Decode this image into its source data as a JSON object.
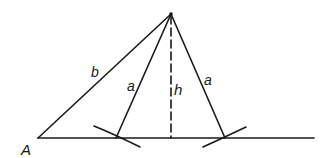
{
  "diagram": {
    "type": "geometric-construction",
    "colors": {
      "stroke": "#1a1a1a",
      "background": "#ffffff"
    },
    "points": {
      "apex": {
        "x": 171,
        "y": 14
      },
      "A": {
        "x": 38,
        "y": 138
      },
      "left_intersection": {
        "x": 116,
        "y": 138
      },
      "right_intersection": {
        "x": 225,
        "y": 138
      },
      "foot": {
        "x": 171,
        "y": 138
      },
      "baseline_end": {
        "x": 314,
        "y": 138
      }
    },
    "labels": {
      "point_A": "A",
      "side_b": "b",
      "side_a_left": "a",
      "height_h": "h",
      "side_a_right": "a"
    },
    "segments": [
      {
        "name": "b",
        "from": "A",
        "to": "apex",
        "style": "solid"
      },
      {
        "name": "a-left",
        "from": "left_intersection",
        "to": "apex",
        "style": "solid"
      },
      {
        "name": "a-right",
        "from": "right_intersection",
        "to": "apex",
        "style": "solid"
      },
      {
        "name": "h",
        "from": "apex",
        "to": "foot",
        "style": "dashed"
      },
      {
        "name": "baseline",
        "from": "A",
        "to": "baseline_end",
        "style": "solid"
      }
    ],
    "arcs": [
      {
        "name": "left-arc",
        "center": "apex",
        "radius_label": "a"
      },
      {
        "name": "right-arc",
        "center": "apex",
        "radius_label": "a"
      }
    ]
  }
}
